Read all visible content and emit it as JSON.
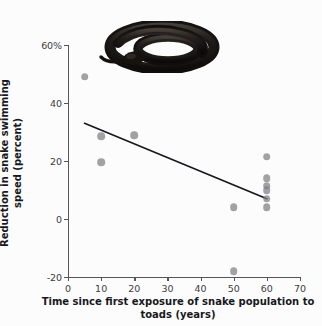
{
  "chart_data": {
    "type": "scatter",
    "title": "",
    "xlabel": "Time since first exposure of snake population to toads (years)",
    "ylabel": "Reduction in snake swimming speed (percent)",
    "xlim": [
      0,
      70
    ],
    "ylim": [
      -20,
      60
    ],
    "grid": false,
    "legend": null,
    "xticks": [
      0,
      10,
      20,
      30,
      40,
      50,
      60,
      70
    ],
    "xtick_labels": [
      "0",
      "10",
      "20",
      "30",
      "40",
      "50",
      "60",
      "70"
    ],
    "yticks": [
      -20,
      0,
      20,
      40,
      60
    ],
    "ytick_labels": [
      "-20",
      "0",
      "20",
      "40",
      "60%"
    ],
    "points": [
      {
        "x": 5,
        "y": 49.0
      },
      {
        "x": 10,
        "y": 28.5
      },
      {
        "x": 10,
        "y": 19.5
      },
      {
        "x": 20,
        "y": 28.8
      },
      {
        "x": 50,
        "y": 4.0
      },
      {
        "x": 50,
        "y": -18.0
      },
      {
        "x": 60,
        "y": 21.5
      },
      {
        "x": 60,
        "y": 14.0
      },
      {
        "x": 60,
        "y": 11.5
      },
      {
        "x": 60,
        "y": 10.0
      },
      {
        "x": 60,
        "y": 7.0
      },
      {
        "x": 60,
        "y": 4.0
      }
    ],
    "trend_line": {
      "x_start": 5,
      "y_start": 33.0,
      "x_end": 60,
      "y_end": 7.0,
      "color": "#17181c"
    },
    "marker_color": "#808082",
    "axis_color": "#55565a",
    "text_color": "#17181c",
    "background_color": "#fcfcfc"
  },
  "decoration": {
    "snake_photo_alt": "coiled dark snake photograph"
  }
}
